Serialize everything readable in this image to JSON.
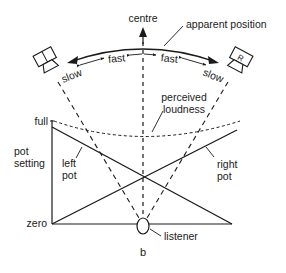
{
  "diagram": {
    "figure_label": "b",
    "top_labels": {
      "centre": "centre",
      "apparent_position": "apparent position"
    },
    "arc_labels": {
      "left_slow": "slow",
      "left_fast": "fast",
      "right_fast": "fast",
      "right_slow": "slow"
    },
    "speakers": {
      "left": "",
      "right": "R"
    },
    "axis": {
      "title_line1": "pot",
      "title_line2": "setting",
      "full": "full",
      "zero": "zero"
    },
    "curves": {
      "perceived_line1": "perceived",
      "perceived_line2": "loudness",
      "left_pot_line1": "left",
      "left_pot_line2": "pot",
      "right_pot_line1": "right",
      "right_pot_line2": "pot"
    },
    "listener": "listener"
  },
  "colors": {
    "ink": "#1a1a1a",
    "background": "#ffffff"
  }
}
